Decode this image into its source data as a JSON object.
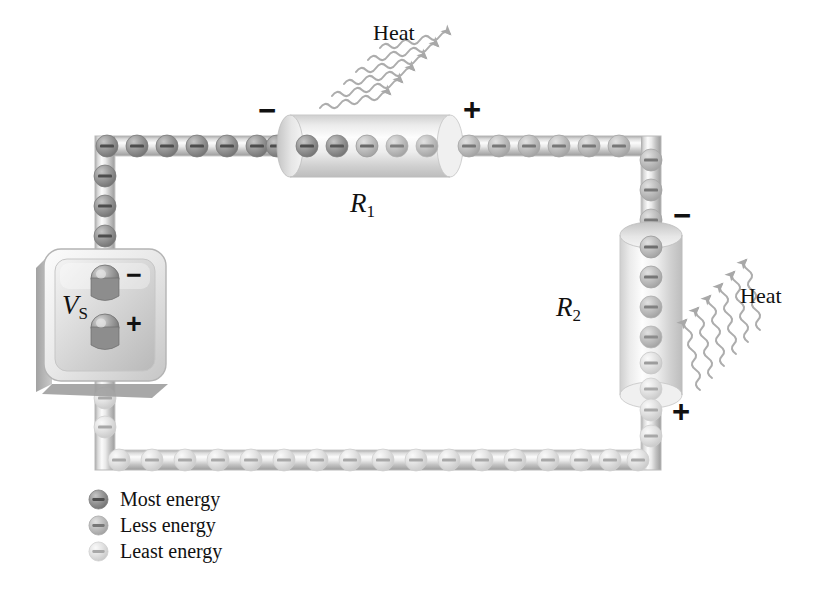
{
  "figure": {
    "background": "#ffffff"
  },
  "source": {
    "name": "voltage-source",
    "label_main": "V",
    "label_sub": "S",
    "terminal_negative": "−",
    "terminal_positive": "+"
  },
  "resistors": [
    {
      "id": "R1",
      "label_main": "R",
      "label_sub": "1",
      "orientation": "horizontal",
      "sign_left": "−",
      "sign_right": "+",
      "electron_count": 5,
      "heat_label": "Heat"
    },
    {
      "id": "R2",
      "label_main": "R",
      "label_sub": "2",
      "orientation": "vertical",
      "sign_top": "−",
      "sign_bottom": "+",
      "electron_count": 6,
      "heat_label": "Heat"
    }
  ],
  "heat": {
    "label": "Heat",
    "arrow_count_r1": 6,
    "arrow_count_r2": 6
  },
  "legend": {
    "items": [
      {
        "label": "Most energy",
        "icon": "electron-icon",
        "color": "#8a8a8a"
      },
      {
        "label": "Less energy",
        "icon": "electron-icon",
        "color": "#b4b4b4"
      },
      {
        "label": "Least energy",
        "icon": "electron-icon",
        "color": "#d8d8d8"
      }
    ]
  },
  "electron_symbol": "−",
  "colors": {
    "wire_light": "#f2f2f2",
    "wire_mid": "#c9c9c9",
    "wire_dark": "#9a9a9a",
    "electron_most": "#8a8a8a",
    "electron_less": "#b4b4b4",
    "electron_least": "#d8d8d8",
    "heat_wave": "#aaaaaa",
    "text": "#111111"
  },
  "electrons": {
    "top_wire_left_energy": "most",
    "top_wire_right_energy": "less",
    "right_wire_upper_energy": "less",
    "right_wire_lower_energy": "least",
    "bottom_wire_energy": "least",
    "left_wire_upper_energy": "most",
    "left_wire_lower_energy": "least"
  }
}
